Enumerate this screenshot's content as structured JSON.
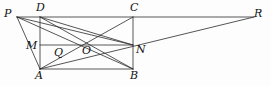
{
  "figure": {
    "kind": "geometry-diagram",
    "stroke_color": "#2b2b2b",
    "background_color": "#fdfdfd",
    "width": 271,
    "height": 86
  },
  "points": {
    "P": {
      "label": "P",
      "x": 17,
      "y": 17,
      "label_x": 4,
      "label_y": 8
    },
    "D": {
      "label": "D",
      "x": 40,
      "y": 17,
      "label_x": 36,
      "label_y": 2
    },
    "C": {
      "label": "C",
      "x": 133,
      "y": 17,
      "label_x": 130,
      "label_y": 2
    },
    "R": {
      "label": "R",
      "x": 254,
      "y": 17,
      "label_x": 254,
      "label_y": 8
    },
    "M": {
      "label": "M",
      "x": 40,
      "y": 45,
      "label_x": 26,
      "label_y": 40
    },
    "N": {
      "label": "N",
      "x": 133,
      "y": 45,
      "label_x": 136,
      "label_y": 44
    },
    "O": {
      "label": "O",
      "x": 86,
      "y": 45,
      "label_x": 82,
      "label_y": 45
    },
    "Q": {
      "label": "Q",
      "x": 58,
      "y": 50,
      "label_x": 54,
      "label_y": 47
    },
    "A": {
      "label": "A",
      "x": 40,
      "y": 69,
      "label_x": 35,
      "label_y": 70
    },
    "B": {
      "label": "B",
      "x": 133,
      "y": 69,
      "label_x": 130,
      "label_y": 70
    }
  },
  "segments": [
    {
      "name": "line-P-R",
      "from": "P",
      "to": "R"
    },
    {
      "name": "side-D-A",
      "from": "D",
      "to": "A"
    },
    {
      "name": "side-C-B",
      "from": "C",
      "to": "B"
    },
    {
      "name": "side-A-B",
      "from": "A",
      "to": "B"
    },
    {
      "name": "midline-M-N",
      "from": "M",
      "to": "N"
    },
    {
      "name": "diagonal-D-B",
      "from": "D",
      "to": "B"
    },
    {
      "name": "diagonal-A-C",
      "from": "A",
      "to": "C"
    },
    {
      "name": "segment-P-A",
      "from": "P",
      "to": "A"
    },
    {
      "name": "segment-P-N",
      "from": "P",
      "to": "N"
    },
    {
      "name": "segment-P-B",
      "from": "P",
      "to": "B"
    },
    {
      "name": "segment-A-R",
      "from": "A",
      "to": "R"
    },
    {
      "name": "segment-D-N",
      "from": "D",
      "to": "N"
    }
  ]
}
